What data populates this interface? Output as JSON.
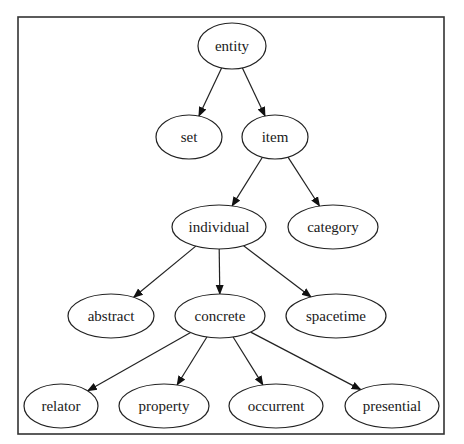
{
  "diagram": {
    "type": "directed-tree",
    "frame": {
      "x": 18,
      "y": 17,
      "width": 426,
      "height": 417
    },
    "nodes": [
      {
        "id": "entity",
        "label": "entity",
        "cx": 232,
        "cy": 46,
        "rx": 34,
        "ry": 23
      },
      {
        "id": "set",
        "label": "set",
        "cx": 189,
        "cy": 137,
        "rx": 33,
        "ry": 22
      },
      {
        "id": "item",
        "label": "item",
        "cx": 275,
        "cy": 137,
        "rx": 33,
        "ry": 22
      },
      {
        "id": "individual",
        "label": "individual",
        "cx": 219,
        "cy": 227,
        "rx": 47,
        "ry": 22
      },
      {
        "id": "category",
        "label": "category",
        "cx": 333,
        "cy": 227,
        "rx": 45,
        "ry": 22
      },
      {
        "id": "abstract",
        "label": "abstract",
        "cx": 111,
        "cy": 316,
        "rx": 43,
        "ry": 22
      },
      {
        "id": "concrete",
        "label": "concrete",
        "cx": 220,
        "cy": 316,
        "rx": 45,
        "ry": 22
      },
      {
        "id": "spacetime",
        "label": "spacetime",
        "cx": 336,
        "cy": 316,
        "rx": 50,
        "ry": 22
      },
      {
        "id": "relator",
        "label": "relator",
        "cx": 61,
        "cy": 406,
        "rx": 37,
        "ry": 22
      },
      {
        "id": "property",
        "label": "property",
        "cx": 164,
        "cy": 406,
        "rx": 45,
        "ry": 22
      },
      {
        "id": "occurrent",
        "label": "occurrent",
        "cx": 276,
        "cy": 406,
        "rx": 47,
        "ry": 22
      },
      {
        "id": "presential",
        "label": "presential",
        "cx": 392,
        "cy": 406,
        "rx": 47,
        "ry": 22
      }
    ],
    "edges": [
      {
        "from": "entity",
        "to": "set"
      },
      {
        "from": "entity",
        "to": "item"
      },
      {
        "from": "item",
        "to": "individual"
      },
      {
        "from": "item",
        "to": "category"
      },
      {
        "from": "individual",
        "to": "abstract"
      },
      {
        "from": "individual",
        "to": "concrete"
      },
      {
        "from": "individual",
        "to": "spacetime"
      },
      {
        "from": "concrete",
        "to": "relator"
      },
      {
        "from": "concrete",
        "to": "property"
      },
      {
        "from": "concrete",
        "to": "occurrent"
      },
      {
        "from": "concrete",
        "to": "presential"
      }
    ],
    "colors": {
      "stroke": "#222222",
      "fill": "#ffffff",
      "text": "#1a1a1a",
      "frame": "#333333"
    }
  }
}
